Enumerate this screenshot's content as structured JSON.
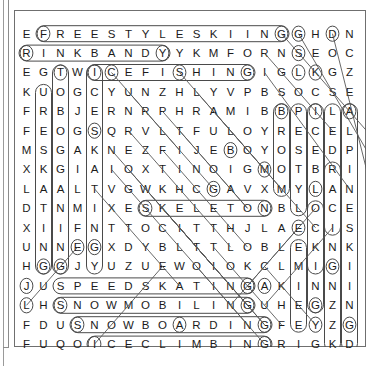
{
  "puzzle": {
    "type": "word-search",
    "rows": 16,
    "cols": 20,
    "grid": [
      [
        "E",
        "F",
        "R",
        "E",
        "E",
        "S",
        "T",
        "Y",
        "L",
        "E",
        "S",
        "K",
        "I",
        "I",
        "N",
        "G",
        "G",
        "H",
        "D",
        "N"
      ],
      [
        "R",
        "I",
        "N",
        "K",
        "B",
        "A",
        "N",
        "D",
        "Y",
        "Y",
        "K",
        "M",
        "F",
        "O",
        "R",
        "N",
        "S",
        "E",
        "O",
        "C"
      ],
      [
        "E",
        "G",
        "T",
        "W",
        "I",
        "C",
        "E",
        "F",
        "I",
        "S",
        "H",
        "I",
        "N",
        "G",
        "I",
        "G",
        "L",
        "K",
        "G",
        "Z"
      ],
      [
        "K",
        "U",
        "O",
        "G",
        "C",
        "Y",
        "U",
        "N",
        "Z",
        "H",
        "L",
        "Y",
        "V",
        "P",
        "B",
        "S",
        "O",
        "C",
        "S",
        "E"
      ],
      [
        "F",
        "R",
        "B",
        "J",
        "E",
        "R",
        "N",
        "R",
        "P",
        "H",
        "R",
        "A",
        "M",
        "I",
        "B",
        "B",
        "P",
        "I",
        "L",
        "A"
      ],
      [
        "F",
        "E",
        "O",
        "G",
        "S",
        "Q",
        "R",
        "V",
        "L",
        "T",
        "F",
        "U",
        "L",
        "O",
        "Y",
        "R",
        "E",
        "C",
        "E",
        "L"
      ],
      [
        "M",
        "S",
        "G",
        "A",
        "K",
        "N",
        "E",
        "Z",
        "F",
        "I",
        "J",
        "E",
        "B",
        "O",
        "Y",
        "O",
        "S",
        "E",
        "D",
        "P"
      ],
      [
        "X",
        "K",
        "G",
        "I",
        "A",
        "I",
        "O",
        "X",
        "T",
        "I",
        "N",
        "O",
        "I",
        "G",
        "M",
        "O",
        "T",
        "B",
        "R",
        "I"
      ],
      [
        "L",
        "A",
        "A",
        "L",
        "T",
        "V",
        "G",
        "W",
        "K",
        "H",
        "C",
        "G",
        "A",
        "V",
        "X",
        "M",
        "Y",
        "L",
        "A",
        "N"
      ],
      [
        "D",
        "T",
        "N",
        "M",
        "I",
        "X",
        "E",
        "S",
        "K",
        "E",
        "L",
        "E",
        "T",
        "O",
        "N",
        "B",
        "L",
        "O",
        "C",
        "E"
      ],
      [
        "X",
        "I",
        "I",
        "F",
        "N",
        "T",
        "T",
        "O",
        "C",
        "I",
        "T",
        "T",
        "H",
        "J",
        "L",
        "A",
        "E",
        "C",
        "I",
        "S"
      ],
      [
        "U",
        "N",
        "N",
        "E",
        "G",
        "X",
        "D",
        "Y",
        "B",
        "L",
        "T",
        "T",
        "L",
        "O",
        "B",
        "L",
        "E",
        "K",
        "N",
        "K"
      ],
      [
        "H",
        "G",
        "G",
        "J",
        "Y",
        "U",
        "Z",
        "U",
        "E",
        "W",
        "O",
        "I",
        "O",
        "K",
        "C",
        "L",
        "M",
        "I",
        "G",
        "I"
      ],
      [
        "J",
        "U",
        "S",
        "P",
        "E",
        "E",
        "D",
        "S",
        "K",
        "A",
        "T",
        "I",
        "N",
        "G",
        "A",
        "K",
        "I",
        "N",
        "N",
        "I"
      ],
      [
        "L",
        "H",
        "S",
        "N",
        "O",
        "W",
        "M",
        "O",
        "B",
        "I",
        "L",
        "I",
        "N",
        "G",
        "U",
        "H",
        "E",
        "G",
        "Z",
        "N"
      ],
      [
        "F",
        "D",
        "U",
        "S",
        "N",
        "O",
        "W",
        "B",
        "O",
        "A",
        "R",
        "D",
        "I",
        "N",
        "G",
        "F",
        "E",
        "Y",
        "Z",
        "G"
      ],
      [
        "F",
        "U",
        "Q",
        "O",
        "I",
        "C",
        "E",
        "C",
        "L",
        "I",
        "M",
        "B",
        "I",
        "N",
        "G",
        "R",
        "I",
        "G",
        "K",
        "D"
      ]
    ],
    "found_words_horizontal": [
      "FREESTYLESKIING",
      "RINKBANDY",
      "ICEFISHING",
      "SKELETON",
      "SPEEDSKATING",
      "SNOWMOBILING",
      "SNOWBOARDING",
      "ICECLIMBING"
    ],
    "found_words_vertical": [
      "TOBOGGANING",
      "ICESKATING",
      "BROOMBALL",
      "ALPINESKIING",
      "ICEBLOCKING",
      "SLEDDING",
      "CURLING"
    ],
    "found_words_diagonal": [
      "LUGE",
      "SNOWSHOEING",
      "BOBSLED"
    ],
    "colors": {
      "letter": "#1b1b1b",
      "border": "#6f6f6f",
      "marker": "#4a4a4a"
    }
  }
}
